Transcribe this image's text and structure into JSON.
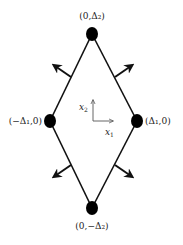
{
  "diagram": {
    "type": "rhombus-with-outward-normals",
    "vertices": [
      {
        "id": "top",
        "label": "(0,Δ₂)",
        "x": 92,
        "y": 34
      },
      {
        "id": "left",
        "label": "(−Δ₁,0)",
        "x": 50,
        "y": 121
      },
      {
        "id": "right",
        "label": "(Δ₁,0)",
        "x": 137,
        "y": 121
      },
      {
        "id": "bottom",
        "label": "(0,−Δ₂)",
        "x": 92,
        "y": 208
      }
    ],
    "axes": {
      "x1_label": "x",
      "x1_sub": "1",
      "x2_label": "x",
      "x2_sub": "2"
    },
    "normals": [
      "upper-left",
      "upper-right",
      "lower-left",
      "lower-right"
    ],
    "colors": {
      "line": "#111111",
      "vertex": "#000000",
      "text": "#222222",
      "axis": "#555555"
    }
  }
}
